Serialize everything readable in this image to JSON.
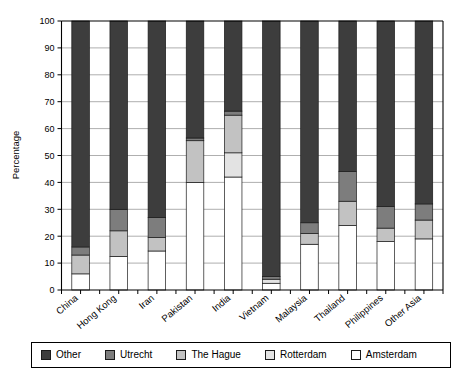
{
  "chart_data": {
    "type": "bar",
    "subtype": "stacked-bar-100",
    "title": "",
    "xlabel": "",
    "ylabel": "Percentage",
    "ylim": [
      0,
      100
    ],
    "yticks": [
      0,
      10,
      20,
      30,
      40,
      50,
      60,
      70,
      80,
      90,
      100
    ],
    "ytick_labels": [
      "0",
      "10",
      "20",
      "30",
      "40",
      "50",
      "60",
      "70",
      "80",
      "90",
      "100"
    ],
    "grid": true,
    "grid_axis": "y",
    "legend_position": "bottom",
    "categories": [
      "China",
      "Hong Kong",
      "Iran",
      "Pakistan",
      "India",
      "Vietnam",
      "Malaysia",
      "Thailand",
      "Philippines",
      "Other Asia"
    ],
    "stack_order_bottom_to_top": [
      "Amsterdam",
      "Rotterdam",
      "The Hague",
      "Utrecht",
      "Other"
    ],
    "series": [
      {
        "name": "Amsterdam",
        "color": "#ffffff",
        "values": [
          6,
          12.5,
          14.5,
          40,
          42,
          2.5,
          17,
          24,
          18,
          19
        ]
      },
      {
        "name": "Rotterdam",
        "color": "#e3e3e3",
        "values": [
          0,
          0,
          0,
          0,
          9,
          1.5,
          0,
          0,
          0,
          0
        ]
      },
      {
        "name": "The Hague",
        "color": "#c2c2c2",
        "values": [
          7,
          9.5,
          5,
          15.5,
          14,
          0,
          4,
          9,
          5,
          7
        ]
      },
      {
        "name": "Utrecht",
        "color": "#7d7d7d",
        "values": [
          3,
          8,
          7.5,
          1,
          1.5,
          1,
          4,
          11,
          8,
          6
        ]
      },
      {
        "name": "Other",
        "color": "#3d3d3d",
        "values": [
          84,
          70,
          73,
          43.5,
          33.5,
          95,
          75,
          56,
          69,
          68
        ]
      }
    ],
    "cumulative_tops": {
      "China": [
        6,
        6,
        13,
        16,
        100
      ],
      "Hong Kong": [
        12.5,
        12.5,
        22,
        30,
        100
      ],
      "Iran": [
        14.5,
        14.5,
        19.5,
        27,
        100
      ],
      "Pakistan": [
        40,
        40,
        55.5,
        56.5,
        100
      ],
      "India": [
        42,
        51,
        65,
        66.5,
        100
      ],
      "Vietnam": [
        2.5,
        4,
        4,
        5,
        100
      ],
      "Malaysia": [
        17,
        17,
        21,
        25,
        100
      ],
      "Thailand": [
        24,
        24,
        33,
        44,
        100
      ],
      "Philippines": [
        18,
        18,
        23,
        31,
        100
      ],
      "Other Asia": [
        19,
        19,
        26,
        32,
        100
      ]
    }
  },
  "legend": {
    "items": [
      {
        "label": "Other",
        "color": "#3d3d3d"
      },
      {
        "label": "Utrecht",
        "color": "#7d7d7d"
      },
      {
        "label": "The Hague",
        "color": "#c2c2c2"
      },
      {
        "label": "Rotterdam",
        "color": "#e3e3e3"
      },
      {
        "label": "Amsterdam",
        "color": "#ffffff"
      }
    ]
  }
}
